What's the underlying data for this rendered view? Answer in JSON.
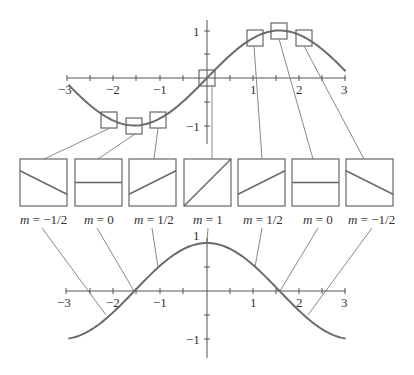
{
  "diagram": {
    "top_graph": {
      "function": "sin(x)",
      "x_ticks": [
        "−3",
        "−2",
        "−1",
        "1",
        "2",
        "3"
      ],
      "y_ticks": [
        "1",
        "−1"
      ],
      "sample_points_x": [
        -2.094,
        -1.571,
        -1.047,
        0,
        1.047,
        1.571,
        2.094
      ]
    },
    "slope_boxes": [
      {
        "label_m": "m",
        "label_eq": " = ",
        "value": "−1/2",
        "slope": -0.5
      },
      {
        "label_m": "m",
        "label_eq": " = ",
        "value": "0",
        "slope": 0
      },
      {
        "label_m": "m",
        "label_eq": " = ",
        "value": "1/2",
        "slope": 0.5
      },
      {
        "label_m": "m",
        "label_eq": " = ",
        "value": "1",
        "slope": 1
      },
      {
        "label_m": "m",
        "label_eq": " = ",
        "value": "1/2",
        "slope": 0.5
      },
      {
        "label_m": "m",
        "label_eq": " = ",
        "value": "0",
        "slope": 0
      },
      {
        "label_m": "m",
        "label_eq": " = ",
        "value": "−1/2",
        "slope": -0.5
      }
    ],
    "bottom_graph": {
      "function": "cos(x)",
      "x_ticks": [
        "−3",
        "−2",
        "−1",
        "1",
        "2",
        "3"
      ],
      "y_ticks": [
        "1",
        "−1"
      ]
    },
    "colors": {
      "curve": "#6b6b6b",
      "axis": "#555555",
      "box": "#666666",
      "leader": "#7a7a7a",
      "text": "#333333"
    }
  }
}
